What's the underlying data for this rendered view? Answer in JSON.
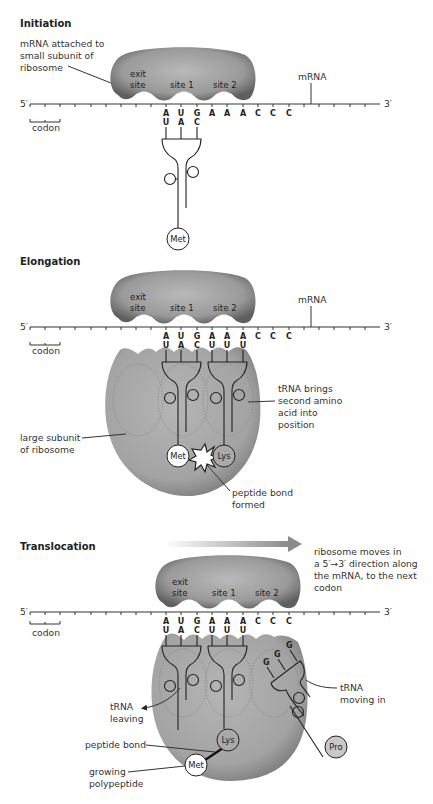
{
  "panels": [
    {
      "title": "Initiation",
      "labels": {
        "small_subunit": "mRNA attached to small subunit of ribosome",
        "small_subunit_lines": [
          "mRNA attached to",
          "small subunit of",
          "ribosome"
        ],
        "mrna": "mRNA",
        "five_prime": "5′",
        "three_prime": "3′",
        "codon": "codon",
        "exit_site": [
          "exit",
          "site"
        ],
        "site1": "site 1",
        "site2": "site 2"
      },
      "mrna_bases": [
        "A",
        "U",
        "G",
        "A",
        "A",
        "A",
        "C",
        "C",
        "C"
      ],
      "anticodons": [
        [
          "U",
          "A",
          "C"
        ]
      ],
      "amino_acids": [
        "Met"
      ]
    },
    {
      "title": "Elongation",
      "labels": {
        "mrna": "mRNA",
        "five_prime": "5′",
        "three_prime": "3′",
        "codon": "codon",
        "exit_site": [
          "exit",
          "site"
        ],
        "site1": "site 1",
        "site2": "site 2",
        "trna_brings_lines": [
          "tRNA brings",
          "second amino",
          "acid into",
          "position"
        ],
        "large_subunit_lines": [
          "large subunit",
          "of ribosome"
        ],
        "peptide_bond_formed_lines": [
          "peptide bond",
          "formed"
        ]
      },
      "mrna_bases": [
        "A",
        "U",
        "G",
        "A",
        "A",
        "A",
        "C",
        "C",
        "C"
      ],
      "anticodons": [
        [
          "U",
          "A",
          "C"
        ],
        [
          "U",
          "U",
          "U"
        ]
      ],
      "amino_acids": [
        "Met",
        "Lys"
      ]
    },
    {
      "title": "Translocation",
      "labels": {
        "five_prime": "5′",
        "three_prime": "3′",
        "codon": "codon",
        "exit_site": [
          "exit",
          "site"
        ],
        "site1": "site 1",
        "site2": "site 2",
        "moves_lines": [
          "ribosome moves in",
          "a 5′→3′ direction along",
          "the mRNA, to the next",
          "codon"
        ],
        "trna_leaving_lines": [
          "tRNA",
          "leaving"
        ],
        "trna_moving_in_lines": [
          "tRNA",
          "moving in"
        ],
        "peptide_bond": "peptide bond",
        "growing_polypeptide_lines": [
          "growing",
          "polypeptide"
        ]
      },
      "mrna_bases": [
        "A",
        "U",
        "G",
        "A",
        "A",
        "A",
        "C",
        "C",
        "C"
      ],
      "anticodons": [
        [
          "U",
          "A",
          "C"
        ],
        [
          "U",
          "U",
          "U"
        ],
        [
          "G",
          "G",
          "G"
        ]
      ],
      "amino_acids": [
        "Met",
        "Lys",
        "Pro"
      ]
    }
  ],
  "colors": {
    "ribosome_dark": "#6e6e6e",
    "ribosome_light": "#b8b8b8",
    "large_subunit": "#a9a9a9",
    "line": "#333333",
    "pro_fill": "#c8c8c8"
  }
}
